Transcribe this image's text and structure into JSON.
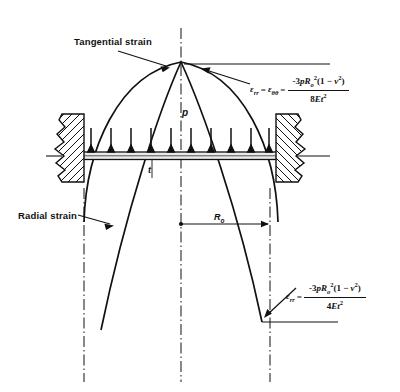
{
  "figure": {
    "labels": {
      "tangential_strain": "Tangential strain",
      "radial_strain": "Radial strain",
      "pressure": "p",
      "thickness": "t",
      "radius": "R",
      "radius_subscript": "o"
    },
    "equations": {
      "center": {
        "name": "center-strain-equation",
        "lhs_first_symbol": "ε",
        "lhs_first_sub": "rr",
        "equals_1": "=",
        "lhs_second_symbol": "ε",
        "lhs_second_sub": "θθ",
        "equals_2": "=",
        "numerator": {
          "sign_coeff": "-3",
          "p": "p",
          "R": "R",
          "R_sub": "o",
          "R_sup": "2",
          "open": "(1 − ",
          "nu": "ν",
          "nu_sup": "2",
          "close": ")"
        },
        "denominator": {
          "coeff": "8",
          "E": "E",
          "t": "t",
          "t_sup": "2"
        }
      },
      "edge": {
        "name": "edge-strain-equation",
        "lhs_first_symbol": "ε",
        "lhs_first_sub": "rr",
        "equals_1": "=",
        "numerator": {
          "sign_coeff": "-3",
          "p": "p",
          "R": "R",
          "R_sub": "o",
          "R_sup": "2",
          "open": "(1 − ",
          "nu": "ν",
          "nu_sup": "2",
          "close": ")"
        },
        "denominator": {
          "coeff": "4",
          "E": "E",
          "t": "t",
          "t_sup": "2"
        }
      }
    },
    "colors": {
      "ink": "#111111",
      "background": "#ffffff"
    },
    "pressure_arrow_count": 10
  }
}
